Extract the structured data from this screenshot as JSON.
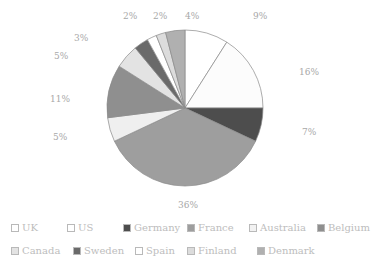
{
  "chart_data": {
    "type": "pie",
    "title": "",
    "subtitle": "",
    "xlabel": "",
    "ylabel": "",
    "grid": false,
    "legend_position": "bottom",
    "start_angle_deg": 0,
    "direction": "clockwise",
    "categories": [
      "UK",
      "US",
      "Germany",
      "France",
      "Australia",
      "Belgium",
      "Canada",
      "Sweden",
      "Spain",
      "Finland",
      "Denmark"
    ],
    "values": [
      9,
      16,
      7,
      36,
      5,
      11,
      5,
      3,
      2,
      2,
      4
    ],
    "value_labels": [
      "9%",
      "16%",
      "7%",
      "36%",
      "5%",
      "11%",
      "5%",
      "3%",
      "2%",
      "2%",
      "4%"
    ],
    "colors": [
      "#ffffff",
      "#fbfbfb",
      "#4d4d4d",
      "#9e9e9e",
      "#efefef",
      "#8f8f8f",
      "#e3e3e3",
      "#6a6a6a",
      "#ffffff",
      "#dcdcdc",
      "#b0b0b0"
    ],
    "slice_border_color": "#8a8a8a",
    "label_color": "#a8a8a8",
    "series": [
      {
        "name": "Share",
        "values": [
          9,
          16,
          7,
          36,
          5,
          11,
          5,
          3,
          2,
          2,
          4
        ]
      }
    ]
  },
  "pie": {
    "center_x": 185,
    "center_y": 108,
    "radius": 78,
    "slices": [
      {
        "name": "UK",
        "value": 9,
        "label": "9%",
        "color": "#ffffff",
        "label_x": 253,
        "label_y": 12
      },
      {
        "name": "US",
        "value": 16,
        "label": "16%",
        "color": "#fcfcfc",
        "label_x": 299,
        "label_y": 68
      },
      {
        "name": "Germany",
        "value": 7,
        "label": "7%",
        "color": "#4d4d4d",
        "label_x": 302,
        "label_y": 128
      },
      {
        "name": "France",
        "value": 36,
        "label": "36%",
        "color": "#9e9e9e",
        "label_x": 178,
        "label_y": 201
      },
      {
        "name": "Australia",
        "value": 5,
        "label": "5%",
        "color": "#efefef",
        "label_x": 53,
        "label_y": 133
      },
      {
        "name": "Belgium",
        "value": 11,
        "label": "11%",
        "color": "#8f8f8f",
        "label_x": 50,
        "label_y": 95
      },
      {
        "name": "Canada",
        "value": 5,
        "label": "5%",
        "color": "#e3e3e3",
        "label_x": 54,
        "label_y": 52
      },
      {
        "name": "Sweden",
        "value": 3,
        "label": "3%",
        "color": "#6a6a6a",
        "label_x": 74,
        "label_y": 34
      },
      {
        "name": "Spain",
        "value": 2,
        "label": "2%",
        "color": "#ffffff",
        "label_x": 123,
        "label_y": 12
      },
      {
        "name": "Finland",
        "value": 2,
        "label": "2%",
        "color": "#dcdcdc",
        "label_x": 153,
        "label_y": 12
      },
      {
        "name": "Denmark",
        "value": 4,
        "label": "4%",
        "color": "#b0b0b0",
        "label_x": 185,
        "label_y": 12
      }
    ]
  },
  "legend": {
    "rows": [
      [
        {
          "label": "UK",
          "color": "#ffffff"
        },
        {
          "label": "US",
          "color": "#ffffff"
        },
        {
          "label": "Germany",
          "color": "#4d4d4d"
        },
        {
          "label": "France",
          "color": "#9e9e9e"
        },
        {
          "label": "Australia",
          "color": "#f2f2f2"
        },
        {
          "label": "Belgium",
          "color": "#8f8f8f"
        }
      ],
      [
        {
          "label": "Canada",
          "color": "#e3e3e3"
        },
        {
          "label": "Sweden",
          "color": "#6a6a6a"
        },
        {
          "label": "Spain",
          "color": "#ffffff"
        },
        {
          "label": "Finland",
          "color": "#dcdcdc"
        },
        {
          "label": "Denmark",
          "color": "#b0b0b0"
        }
      ]
    ],
    "row1_offsets": [
      0,
      56,
      112,
      176,
      238,
      306
    ],
    "row2_offsets": [
      0,
      62,
      124,
      176,
      246
    ]
  }
}
